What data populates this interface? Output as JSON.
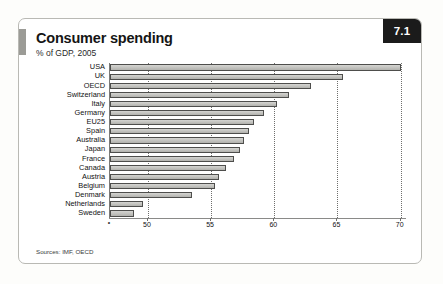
{
  "panel": {
    "badge_number": "7.1",
    "title": "Consumer spending",
    "subtitle": "% of GDP, 2005",
    "source_note": "Sources: IMF, OECD",
    "accent_color": "#9b9b96",
    "badge_bg": "#1b1b1b",
    "bar_fill": "#c6c6c2",
    "bar_stroke": "#4e4e4c"
  },
  "chart_data": {
    "type": "bar",
    "orientation": "horizontal",
    "title": "Consumer spending",
    "subtitle": "% of GDP, 2005",
    "xlabel": "",
    "ylabel": "",
    "xlim": [
      47,
      70.5
    ],
    "grid": true,
    "legend": "none",
    "xticks": [
      "50",
      "55",
      "60",
      "65",
      "70"
    ],
    "xtick_values": [
      50,
      55,
      60,
      65,
      70
    ],
    "categories": [
      "USA",
      "UK",
      "OECD",
      "Switzerland",
      "Italy",
      "Germany",
      "EU25",
      "Spain",
      "Australia",
      "Japan",
      "France",
      "Canada",
      "Austria",
      "Belgium",
      "Denmark",
      "Netherlands",
      "Sweden"
    ],
    "values": [
      70.0,
      65.4,
      62.9,
      61.2,
      60.2,
      59.2,
      58.4,
      58.0,
      57.6,
      57.3,
      56.8,
      56.2,
      55.6,
      55.3,
      53.5,
      49.6,
      48.9
    ],
    "source": "Sources: IMF, OECD"
  }
}
